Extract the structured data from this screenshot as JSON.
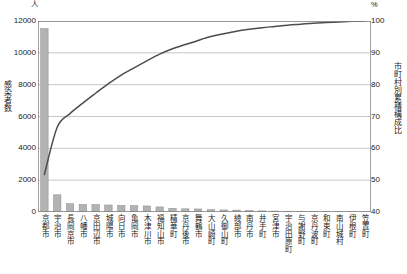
{
  "chart_data": {
    "type": "bar",
    "title": "",
    "subtitle": "",
    "xlabel": "",
    "ylabel": "感染者数",
    "y2label": "市町村別累積構成比",
    "unit_left": "人",
    "unit_right": "%",
    "grid": true,
    "legend": "none",
    "ylim": [
      0,
      12000
    ],
    "y2lim": [
      40,
      100
    ],
    "yticks": [
      "0",
      "2000",
      "4000",
      "6000",
      "8000",
      "10000",
      "12000"
    ],
    "ytick_values": [
      0,
      2000,
      4000,
      6000,
      8000,
      10000,
      12000
    ],
    "y2ticks": [
      "40",
      "50",
      "60",
      "70",
      "80",
      "90",
      "100"
    ],
    "y2tick_values": [
      40,
      50,
      60,
      70,
      80,
      90,
      100
    ],
    "categories": [
      "京都市",
      "宇治市",
      "長岡京市",
      "八幡市",
      "京田辺市",
      "城陽市",
      "向日市",
      "亀岡市",
      "木津川市",
      "福知山市",
      "精華町",
      "京丹後市",
      "舞鶴市",
      "大山崎町",
      "久御山町",
      "綾部市",
      "南丹市",
      "井手町",
      "宮津市",
      "宇治田原町",
      "与謝野町",
      "京丹波町",
      "和束町",
      "南山城村",
      "伊根町",
      "笠置町"
    ],
    "series": [
      {
        "name": "感染者数",
        "type": "bar",
        "color": "#b3b3b3",
        "edge_color": "#8c8c8c",
        "axis": "left",
        "values": [
          11520,
          1080,
          520,
          480,
          470,
          440,
          420,
          400,
          380,
          320,
          230,
          200,
          190,
          150,
          130,
          120,
          95,
          70,
          60,
          50,
          45,
          35,
          25,
          18,
          12,
          8
        ]
      },
      {
        "name": "市町村別累積構成比",
        "type": "line",
        "color": "#4d4d4d",
        "axis": "right",
        "values": [
          51.8,
          66.6,
          70.9,
          74.2,
          77.3,
          80.3,
          83.0,
          85.3,
          87.5,
          89.6,
          91.3,
          92.6,
          93.9,
          95.1,
          96.0,
          96.8,
          97.4,
          97.9,
          98.3,
          98.7,
          99.0,
          99.3,
          99.5,
          99.7,
          99.9,
          100.0
        ]
      }
    ]
  },
  "chart": {
    "frame_color": "#808080",
    "grid_color": "#b0b0b0",
    "background": "#ffffff"
  }
}
